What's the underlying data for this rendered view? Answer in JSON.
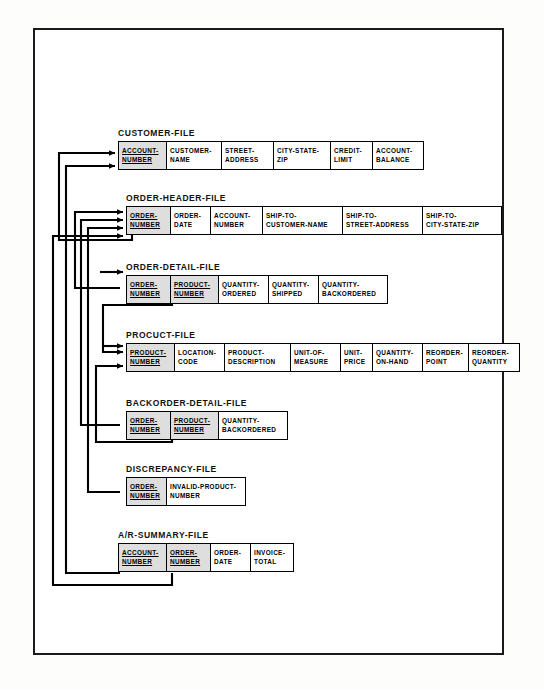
{
  "diagram": {
    "frame_color": "#1a1a1a",
    "key_field_fill": "#dedede",
    "line_color": "#000000",
    "groups": [
      {
        "id": "customer-file",
        "label": "CUSTOMER-FILE",
        "fields": [
          {
            "lines": [
              "ACCOUNT-",
              "NUMBER"
            ],
            "key": true,
            "width": 48
          },
          {
            "lines": [
              "CUSTOMER-",
              "NAME"
            ],
            "key": false,
            "width": 55
          },
          {
            "lines": [
              "STREET-",
              "ADDRESS"
            ],
            "key": false,
            "width": 52
          },
          {
            "lines": [
              "CITY-STATE-",
              "ZIP"
            ],
            "key": false,
            "width": 57
          },
          {
            "lines": [
              "CREDIT-",
              "LIMIT"
            ],
            "key": false,
            "width": 42
          },
          {
            "lines": [
              "ACCOUNT-",
              "BALANCE"
            ],
            "key": false,
            "width": 50
          }
        ]
      },
      {
        "id": "order-header-file",
        "label": "ORDER-HEADER-FILE",
        "fields": [
          {
            "lines": [
              "ORDER-",
              "NUMBER"
            ],
            "key": true,
            "width": 44
          },
          {
            "lines": [
              "ORDER-",
              "DATE"
            ],
            "key": false,
            "width": 40
          },
          {
            "lines": [
              "ACCOUNT-",
              "NUMBER"
            ],
            "key": false,
            "width": 52
          },
          {
            "lines": [
              "SHIP-TO-",
              "CUSTOMER-NAME"
            ],
            "key": false,
            "width": 80
          },
          {
            "lines": [
              "SHIP-TO-",
              "STREET-ADDRESS"
            ],
            "key": false,
            "width": 80
          },
          {
            "lines": [
              "SHIP-TO-",
              "CITY-STATE-ZIP"
            ],
            "key": false,
            "width": 78
          }
        ]
      },
      {
        "id": "order-detail-file",
        "label": "ORDER-DETAIL-FILE",
        "fields": [
          {
            "lines": [
              "ORDER-",
              "NUMBER"
            ],
            "key": true,
            "width": 44
          },
          {
            "lines": [
              "PRODUCT-",
              "NUMBER"
            ],
            "key": true,
            "width": 48
          },
          {
            "lines": [
              "QUANTITY-",
              "ORDERED"
            ],
            "key": false,
            "width": 50
          },
          {
            "lines": [
              "QUANTITY-",
              "SHIPPED"
            ],
            "key": false,
            "width": 50
          },
          {
            "lines": [
              "QUANTITY-",
              "BACKORDERED"
            ],
            "key": false,
            "width": 68
          }
        ]
      },
      {
        "id": "product-file",
        "label": "PROCUCT-FILE",
        "fields": [
          {
            "lines": [
              "PRODUCT-",
              "NUMBER"
            ],
            "key": true,
            "width": 48
          },
          {
            "lines": [
              "LOCATION-",
              "CODE"
            ],
            "key": false,
            "width": 50
          },
          {
            "lines": [
              "PRODUCT-",
              "DESCRIPTION"
            ],
            "key": false,
            "width": 66
          },
          {
            "lines": [
              "UNIT-OF-",
              "MEASURE"
            ],
            "key": false,
            "width": 50
          },
          {
            "lines": [
              "UNIT-",
              "PRICE"
            ],
            "key": false,
            "width": 32
          },
          {
            "lines": [
              "QUANTITY-",
              "ON-HAND"
            ],
            "key": false,
            "width": 50
          },
          {
            "lines": [
              "REORDER-",
              "POINT"
            ],
            "key": false,
            "width": 46
          },
          {
            "lines": [
              "REORDER-",
              "QUANTITY"
            ],
            "key": false,
            "width": 50
          }
        ]
      },
      {
        "id": "backorder-detail-file",
        "label": "BACKORDER-DETAIL-FILE",
        "fields": [
          {
            "lines": [
              "ORDER-",
              "NUMBER"
            ],
            "key": true,
            "width": 44
          },
          {
            "lines": [
              "PRODUCT-",
              "NUMBER"
            ],
            "key": true,
            "width": 48
          },
          {
            "lines": [
              "QUANTITY-",
              "BACKORDERED"
            ],
            "key": false,
            "width": 68
          }
        ]
      },
      {
        "id": "discrepancy-file",
        "label": "DISCREPANCY-FILE",
        "fields": [
          {
            "lines": [
              "ORDER-",
              "NUMBER"
            ],
            "key": true,
            "width": 40
          },
          {
            "lines": [
              "INVALID-PRODUCT-",
              "NUMBER"
            ],
            "key": false,
            "width": 78
          }
        ]
      },
      {
        "id": "ar-summary-file",
        "label": "A/R-SUMMARY-FILE",
        "fields": [
          {
            "lines": [
              "ACCOUNT-",
              "NUMBER"
            ],
            "key": true,
            "width": 48
          },
          {
            "lines": [
              "ORDER-",
              "NUMBER"
            ],
            "key": true,
            "width": 44
          },
          {
            "lines": [
              "ORDER-",
              "DATE"
            ],
            "key": false,
            "width": 40
          },
          {
            "lines": [
              "INVOICE-",
              "TOTAL"
            ],
            "key": false,
            "width": 42
          }
        ]
      }
    ]
  }
}
